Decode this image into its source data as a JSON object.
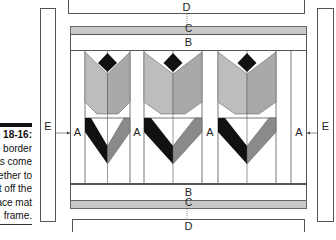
{
  "caption": {
    "title": "Figure 18-16:",
    "lines": [
      "The border",
      "strips come",
      "together to",
      "set off the",
      "lace mat",
      "frame."
    ]
  },
  "labels": {
    "A": "A",
    "B": "B",
    "C": "C",
    "D": "D",
    "E": "E"
  },
  "colors": {
    "black": "#111111",
    "light_grey": "#bdbdbd",
    "mid_grey": "#a9a9a9",
    "dark_grey": "#8a8a8a",
    "strip_grey": "#c8c8c8"
  },
  "blocks": 3
}
